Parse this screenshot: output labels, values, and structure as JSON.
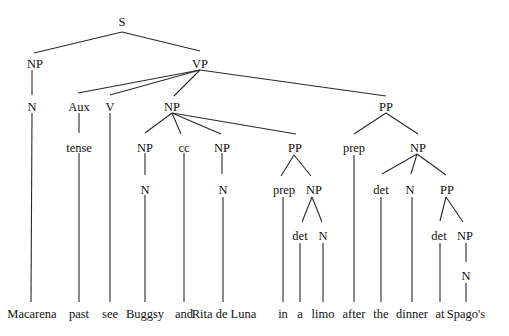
{
  "diagram": {
    "type": "syntax-parse-tree",
    "sentence": "Macarena past see Buggsy and Rita de Luna in a limo after the dinner at Spago's",
    "nodes": [
      {
        "id": "S",
        "label": "S",
        "x": 122,
        "y": 22
      },
      {
        "id": "NP1",
        "label": "NP",
        "x": 35,
        "y": 64
      },
      {
        "id": "VP",
        "label": "VP",
        "x": 200,
        "y": 64
      },
      {
        "id": "N1",
        "label": "N",
        "x": 32,
        "y": 107
      },
      {
        "id": "Aux",
        "label": "Aux",
        "x": 79,
        "y": 107
      },
      {
        "id": "V",
        "label": "V",
        "x": 110,
        "y": 107
      },
      {
        "id": "NP2",
        "label": "NP",
        "x": 172,
        "y": 107
      },
      {
        "id": "PP1",
        "label": "PP",
        "x": 386,
        "y": 107
      },
      {
        "id": "tense",
        "label": "tense",
        "x": 79,
        "y": 148
      },
      {
        "id": "NP3",
        "label": "NP",
        "x": 145,
        "y": 148
      },
      {
        "id": "cc",
        "label": "cc",
        "x": 184,
        "y": 148
      },
      {
        "id": "NP4",
        "label": "NP",
        "x": 222,
        "y": 148
      },
      {
        "id": "PP2",
        "label": "PP",
        "x": 295,
        "y": 148
      },
      {
        "id": "prep1",
        "label": "prep",
        "x": 354,
        "y": 148
      },
      {
        "id": "NP5",
        "label": "NP",
        "x": 418,
        "y": 148
      },
      {
        "id": "N2",
        "label": "N",
        "x": 145,
        "y": 190
      },
      {
        "id": "N3",
        "label": "N",
        "x": 223,
        "y": 190
      },
      {
        "id": "prep2",
        "label": "prep",
        "x": 284,
        "y": 190
      },
      {
        "id": "NP6",
        "label": "NP",
        "x": 314,
        "y": 190
      },
      {
        "id": "det1",
        "label": "det",
        "x": 381,
        "y": 190
      },
      {
        "id": "N4",
        "label": "N",
        "x": 410,
        "y": 190
      },
      {
        "id": "PP3",
        "label": "PP",
        "x": 447,
        "y": 190
      },
      {
        "id": "det2",
        "label": "det",
        "x": 300,
        "y": 236
      },
      {
        "id": "N5",
        "label": "N",
        "x": 323,
        "y": 236
      },
      {
        "id": "det3",
        "label": "det",
        "x": 439,
        "y": 236
      },
      {
        "id": "NP7",
        "label": "NP",
        "x": 465,
        "y": 236
      },
      {
        "id": "N6",
        "label": "N",
        "x": 466,
        "y": 276
      }
    ],
    "words": [
      {
        "text": "Macarena",
        "x": 32
      },
      {
        "text": "past",
        "x": 79
      },
      {
        "text": "see",
        "x": 110
      },
      {
        "text": "Buggsy",
        "x": 145
      },
      {
        "text": "and",
        "x": 184
      },
      {
        "text": "Rita de Luna",
        "x": 224
      },
      {
        "text": "in",
        "x": 283
      },
      {
        "text": "a",
        "x": 300
      },
      {
        "text": "limo",
        "x": 323
      },
      {
        "text": "after",
        "x": 354
      },
      {
        "text": "the",
        "x": 381
      },
      {
        "text": "dinner",
        "x": 412
      },
      {
        "text": "at",
        "x": 440
      },
      {
        "text": "Spago's",
        "x": 466
      }
    ],
    "words_y": 318
  }
}
